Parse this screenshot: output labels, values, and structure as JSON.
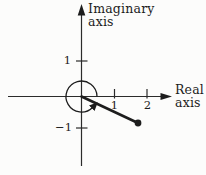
{
  "figure": {
    "type": "complex-plane-argand-diagram",
    "imaginary_axis": {
      "label_line1": "Imaginary",
      "label_line2": "axis",
      "tick_positive": "1",
      "tick_negative": "−1"
    },
    "real_axis": {
      "label_line1": "Real",
      "label_line2": "axis",
      "tick_1": "1",
      "tick_2": "2"
    },
    "plot": {
      "point": {
        "real": 1.7,
        "imag": -0.85
      },
      "segment": "from origin to point, filled dot endpoint",
      "angle_arc": {
        "direction": "counterclockwise",
        "from": "positive real axis",
        "to": "ray toward point",
        "arrowhead": true
      }
    }
  },
  "colors": {
    "ink": "#1d1d1d",
    "axis_stroke": "#2b2b2b",
    "background": "#fcfcfb"
  }
}
